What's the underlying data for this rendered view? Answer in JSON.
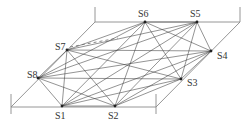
{
  "diagram": {
    "type": "complete-graph-on-parallelogram",
    "colors": {
      "frame": "#8a8a8a",
      "edge": "#3a3a3a",
      "node": "#222222",
      "label": "#333333"
    },
    "nodes": [
      {
        "id": "S1",
        "label": "S1",
        "x": 62,
        "y": 106,
        "lx": 55,
        "ly": 119
      },
      {
        "id": "S2",
        "label": "S2",
        "x": 115,
        "y": 106,
        "lx": 108,
        "ly": 119
      },
      {
        "id": "S3",
        "label": "S3",
        "x": 181,
        "y": 79,
        "lx": 187,
        "ly": 86
      },
      {
        "id": "S4",
        "label": "S4",
        "x": 211,
        "y": 51,
        "lx": 217,
        "ly": 59
      },
      {
        "id": "S5",
        "label": "S5",
        "x": 197,
        "y": 22,
        "lx": 190,
        "ly": 17
      },
      {
        "id": "S6",
        "label": "S6",
        "x": 145,
        "y": 22,
        "lx": 138,
        "ly": 17
      },
      {
        "id": "S7",
        "label": "S7",
        "x": 67,
        "y": 50,
        "lx": 55,
        "ly": 50
      },
      {
        "id": "S8",
        "label": "S8",
        "x": 38,
        "y": 78,
        "lx": 27,
        "ly": 78
      }
    ],
    "frame": {
      "top_edge": {
        "x1": 95,
        "y1": 22,
        "x2": 240,
        "y2": 22
      },
      "bottom_edge": {
        "x1": 11,
        "y1": 107,
        "x2": 156,
        "y2": 107
      },
      "left_edge": {
        "x1": 95,
        "y1": 22,
        "x2": 11,
        "y2": 107
      },
      "right_edge": {
        "x1": 240,
        "y1": 22,
        "x2": 156,
        "y2": 107
      },
      "ticks": [
        {
          "x1": 95,
          "y1": 7,
          "x2": 95,
          "y2": 22
        },
        {
          "x1": 240,
          "y1": 7,
          "x2": 240,
          "y2": 22
        },
        {
          "x1": 11,
          "y1": 94,
          "x2": 11,
          "y2": 114
        },
        {
          "x1": 156,
          "y1": 94,
          "x2": 156,
          "y2": 114
        }
      ]
    },
    "dashed_segment": {
      "x1": 70,
      "y1": 47,
      "x2": 118,
      "y2": 38
    },
    "edges": "all-pairs"
  }
}
